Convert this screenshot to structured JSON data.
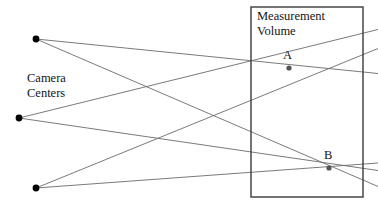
{
  "figure": {
    "type": "geometric-diagram",
    "title_text_blocks": {
      "measurement_volume": "Measurement\nVolume",
      "camera_centers": "Camera\nCenters",
      "point_a": "A",
      "point_b": "B"
    },
    "canvas": {
      "width": 378,
      "height": 214,
      "background": "#ffffff"
    },
    "colors": {
      "ray_stroke": "#6b6b6b",
      "box_stroke": "#3a3a3a",
      "point_fill": "#000000",
      "intersection_fill": "#555555",
      "text": "#141414"
    },
    "measurement_volume_box": {
      "x": 251,
      "y": 7,
      "width": 112,
      "height": 190,
      "stroke_width": 1.4
    },
    "camera_centers": [
      {
        "name": "camera-center-top",
        "x": 36,
        "y": 39,
        "r": 3.4
      },
      {
        "name": "camera-center-middle",
        "x": 19,
        "y": 118,
        "r": 3.4
      },
      {
        "name": "camera-center-bottom",
        "x": 36,
        "y": 188,
        "r": 3.4
      }
    ],
    "intersection_points": [
      {
        "name": "point-a",
        "label": "A",
        "x": 289,
        "y": 68,
        "r": 2.6
      },
      {
        "name": "point-b",
        "label": "B",
        "x": 329,
        "y": 168,
        "r": 2.6
      }
    ],
    "rays": [
      {
        "name": "ray-top-to-a",
        "from": "camera-center-top",
        "through": "point-a",
        "x1": 36,
        "y1": 39,
        "x2": 378,
        "y2": 73.5
      },
      {
        "name": "ray-top-to-b",
        "from": "camera-center-top",
        "through": "point-b",
        "x1": 36,
        "y1": 39,
        "x2": 378,
        "y2": 186.5
      },
      {
        "name": "ray-mid-to-a",
        "from": "camera-center-middle",
        "through": "point-a",
        "x1": 19,
        "y1": 118,
        "x2": 378,
        "y2": 29.5
      },
      {
        "name": "ray-mid-to-b",
        "from": "camera-center-middle",
        "through": "point-b",
        "x1": 19,
        "y1": 118,
        "x2": 378,
        "y2": 170.5
      },
      {
        "name": "ray-bot-to-a",
        "from": "camera-center-bottom",
        "through": "point-a",
        "x1": 36,
        "y1": 188,
        "x2": 378,
        "y2": 48.5
      },
      {
        "name": "ray-bot-to-b",
        "from": "camera-center-bottom",
        "through": "point-b",
        "x1": 36,
        "y1": 188,
        "x2": 378,
        "y2": 163.0
      }
    ]
  }
}
